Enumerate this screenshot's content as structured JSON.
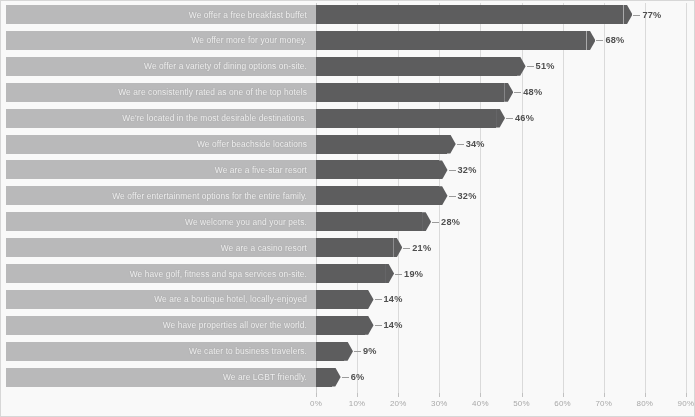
{
  "chart_data": {
    "type": "bar",
    "orientation": "horizontal",
    "title": "",
    "subtitle": "",
    "xlabel": "",
    "ylabel": "",
    "xlim": [
      0,
      90
    ],
    "grid": true,
    "legend": null,
    "value_suffix": "%",
    "xticks": [
      "0%",
      "10%",
      "20%",
      "30%",
      "40%",
      "50%",
      "60%",
      "70%",
      "80%",
      "90%"
    ],
    "xtick_values": [
      0,
      10,
      20,
      30,
      40,
      50,
      60,
      70,
      80,
      90
    ],
    "categories": [
      "We offer a free breakfast buffet",
      "We offer more for your money.",
      "We offer a variety of dining options on-site.",
      "We are consistently rated as one of the top hotels",
      "We're located in the most desirable destinations.",
      "We offer beachside locations",
      "We are a five-star resort",
      "We offer entertainment options for the entire family.",
      "We welcome you and your pets.",
      "We are a casino resort",
      "We have golf, fitness and spa services on-site.",
      "We are a boutique hotel, locally-enjoyed",
      "We have properties all over the world.",
      "We cater to business travelers.",
      "We are LGBT friendly."
    ],
    "values": [
      77,
      68,
      51,
      48,
      46,
      34,
      32,
      32,
      28,
      21,
      19,
      14,
      14,
      9,
      6
    ],
    "value_labels": [
      "77%",
      "68%",
      "51%",
      "48%",
      "46%",
      "34%",
      "32%",
      "32%",
      "28%",
      "21%",
      "19%",
      "14%",
      "14%",
      "9%",
      "6%"
    ],
    "colors": {
      "bar": "#58585a",
      "label_bar": "#b9b9ba",
      "label_text": "#f4f4f4",
      "value_text": "#4a4a4a",
      "gridline": "#dcdcdc",
      "tick_text": "#a8a8a8",
      "background": "#fdfdfd"
    }
  }
}
